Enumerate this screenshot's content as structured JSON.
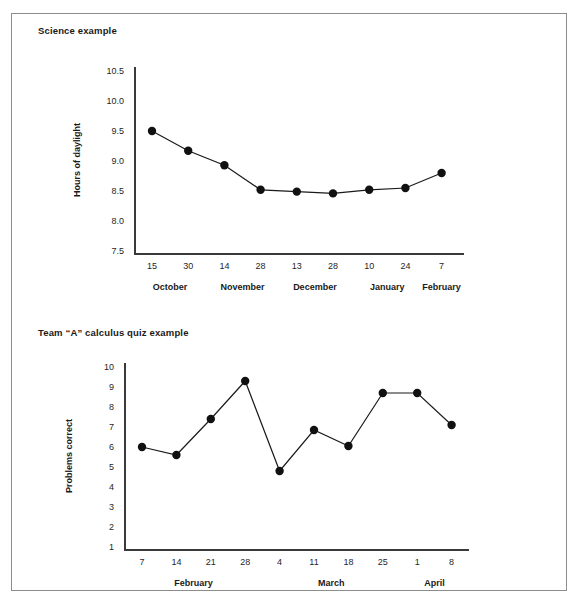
{
  "figures": [
    {
      "id": "science-example",
      "title": "Science example",
      "chart_data": {
        "type": "line",
        "title": "Science example",
        "xlabel": "",
        "ylabel": "Hours of daylight",
        "ylim": [
          7.5,
          10.5
        ],
        "yticks": [
          "10.5",
          "10.0",
          "9.5",
          "9.0",
          "8.5",
          "8.0",
          "7.5"
        ],
        "ytick_values": [
          10.5,
          10.0,
          9.5,
          9.0,
          8.5,
          8.0,
          7.5
        ],
        "categories": [
          "15",
          "30",
          "14",
          "28",
          "13",
          "28",
          "10",
          "24",
          "7"
        ],
        "values": [
          9.5,
          9.17,
          8.93,
          8.52,
          8.49,
          8.46,
          8.52,
          8.55,
          8.8
        ],
        "groups": [
          {
            "label": "October",
            "start": 0,
            "end": 1
          },
          {
            "label": "November",
            "start": 2,
            "end": 3
          },
          {
            "label": "December",
            "start": 4,
            "end": 5
          },
          {
            "label": "January",
            "start": 6,
            "end": 7
          },
          {
            "label": "February",
            "start": 8,
            "end": 8
          }
        ],
        "grid": false,
        "legend": "none",
        "marker": "filled-circle",
        "line_color": "#1a1a1a",
        "marker_color": "#111111"
      }
    },
    {
      "id": "calculus-quiz-example",
      "title": "Team “A” calculus quiz example",
      "chart_data": {
        "type": "line",
        "title": "Team “A” calculus quiz example",
        "xlabel": "",
        "ylabel": "Problems correct",
        "ylim": [
          1,
          10
        ],
        "yticks": [
          "10",
          "9",
          "8",
          "7",
          "6",
          "5",
          "4",
          "3",
          "2",
          "1"
        ],
        "ytick_values": [
          10,
          9,
          8,
          7,
          6,
          5,
          4,
          3,
          2,
          1
        ],
        "categories": [
          "7",
          "14",
          "21",
          "28",
          "4",
          "11",
          "18",
          "25",
          "1",
          "8"
        ],
        "values": [
          6.0,
          5.6,
          7.4,
          9.3,
          4.8,
          6.85,
          6.05,
          8.7,
          8.7,
          7.1
        ],
        "groups": [
          {
            "label": "February",
            "start": 0,
            "end": 3
          },
          {
            "label": "March",
            "start": 4,
            "end": 7
          },
          {
            "label": "April",
            "start": 8,
            "end": 9
          }
        ],
        "grid": false,
        "legend": "none",
        "marker": "filled-circle",
        "line_color": "#1a1a1a",
        "marker_color": "#111111"
      }
    }
  ],
  "style": {
    "frame_color": "#8d8d8d",
    "axis_color": "#3a3a3a",
    "text_color": "#1f1f1f",
    "background": "#ffffff"
  }
}
